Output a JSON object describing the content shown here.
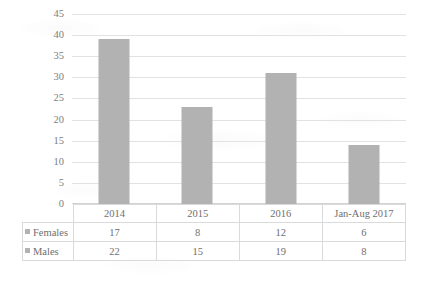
{
  "chart_data": {
    "type": "bar",
    "title": "",
    "subtitle": "",
    "xlabel": "",
    "ylabel": "",
    "categories": [
      "2014",
      "2015",
      "2016",
      "Jan-Aug 2017"
    ],
    "values": [
      39,
      23,
      31,
      14
    ],
    "series": [
      {
        "name": "Females",
        "values": [
          17,
          8,
          12,
          6
        ]
      },
      {
        "name": "Males",
        "values": [
          22,
          15,
          19,
          8
        ]
      }
    ],
    "plotted_series": [
      {
        "name": "Total",
        "values": [
          39,
          23,
          31,
          14
        ]
      }
    ],
    "ylim": [
      0,
      45
    ],
    "ytick_step": 5,
    "yticks": [
      45,
      40,
      35,
      30,
      25,
      20,
      15,
      10,
      5,
      0
    ],
    "grid": true,
    "legend_position": "table-left",
    "bar_color": "#b2b2b2",
    "gridline_color": "#e2e2e2",
    "axis_label_color": "#808080",
    "table_border_color": "#dadada",
    "note": "Column chart with attached data table; bar heights equal Females + Males totals"
  },
  "table": {
    "columns": [
      "2014",
      "2015",
      "2016",
      "Jan-Aug 2017"
    ],
    "rows": [
      {
        "label": "Females",
        "cells": [
          "17",
          "8",
          "12",
          "6"
        ]
      },
      {
        "label": "Males",
        "cells": [
          "22",
          "15",
          "19",
          "8"
        ]
      }
    ]
  }
}
